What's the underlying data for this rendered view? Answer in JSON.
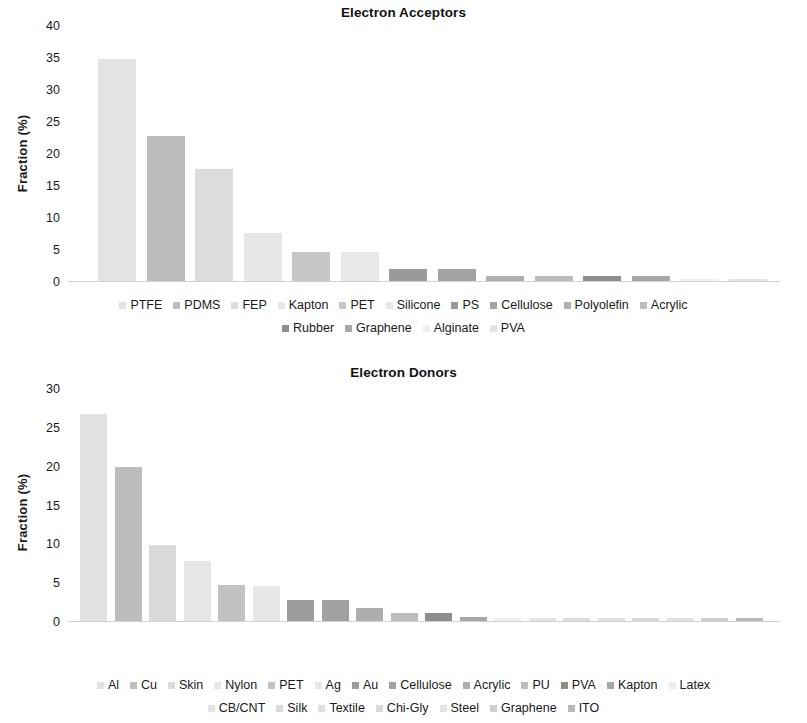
{
  "chart_data": [
    {
      "type": "bar",
      "title": "Electron Acceptors",
      "xlabel": "",
      "ylabel": "Fraction (%)",
      "ylim": [
        0,
        40
      ],
      "yticks": [
        0,
        5,
        10,
        15,
        20,
        25,
        30,
        35,
        40
      ],
      "grid": false,
      "legend_position": "bottom",
      "categories": [
        "PTFE",
        "PDMS",
        "FEP",
        "Kapton",
        "PET",
        "Silicone",
        "PS",
        "Cellulose",
        "Polyolefin",
        "Acrylic",
        "Rubber",
        "Graphene",
        "Alginate",
        "PVA"
      ],
      "values": [
        34.8,
        22.8,
        17.6,
        7.6,
        4.7,
        4.7,
        2.0,
        2.0,
        1.0,
        1.0,
        1.0,
        1.0,
        0.4,
        0.4
      ],
      "colors": [
        "#e3e3e3",
        "#bcbcbc",
        "#dcdcdc",
        "#e6e6e6",
        "#c6c6c6",
        "#e8e8e8",
        "#9a9a9a",
        "#a3a3a3",
        "#b0b0b0",
        "#bdbdbd",
        "#8f8f8f",
        "#a8a8a8",
        "#efefef",
        "#e4e4e4"
      ]
    },
    {
      "type": "bar",
      "title": "Electron Donors",
      "xlabel": "",
      "ylabel": "Fraction (%)",
      "ylim": [
        0,
        30
      ],
      "yticks": [
        0,
        5,
        10,
        15,
        20,
        25,
        30
      ],
      "grid": false,
      "legend_position": "bottom",
      "categories": [
        "Al",
        "Cu",
        "Skin",
        "Nylon",
        "PET",
        "Ag",
        "Au",
        "Cellulose",
        "Acrylic",
        "PU",
        "PVA",
        "Kapton",
        "Latex",
        "CB/CNT",
        "Silk",
        "Textile",
        "Chi-Gly",
        "Steel",
        "Graphene",
        "ITO"
      ],
      "values": [
        26.8,
        19.9,
        9.9,
        7.8,
        4.8,
        4.7,
        2.8,
        2.8,
        1.8,
        1.2,
        1.2,
        0.7,
        0.5,
        0.5,
        0.5,
        0.5,
        0.5,
        0.5,
        0.5,
        0.5
      ],
      "colors": [
        "#e2e2e2",
        "#bdbdbd",
        "#dadada",
        "#e6e6e6",
        "#c2c2c2",
        "#e7e7e7",
        "#9c9c9c",
        "#a1a1a1",
        "#aeaeae",
        "#bdbdbd",
        "#8d8d8d",
        "#a7a7a7",
        "#ededed",
        "#e3e3e3",
        "#dcdcdc",
        "#e0e0e0",
        "#d8d8d8",
        "#e2e2e2",
        "#cfcfcf",
        "#b9b9b9"
      ]
    }
  ],
  "acceptors": {
    "title": "Electron Acceptors",
    "ylabel": "Fraction (%)",
    "yticks": [
      "0",
      "5",
      "10",
      "15",
      "20",
      "25",
      "30",
      "35",
      "40"
    ],
    "legend_row_1": [
      "PTFE",
      "PDMS",
      "FEP",
      "Kapton",
      "PET",
      "Silicone",
      "PS",
      "Cellulose",
      "Polyolefin",
      "Acrylic"
    ],
    "legend_row_2": [
      "Rubber",
      "Graphene",
      "Alginate",
      "PVA"
    ]
  },
  "donors": {
    "title": "Electron Donors",
    "ylabel": "Fraction (%)",
    "yticks": [
      "0",
      "5",
      "10",
      "15",
      "20",
      "25",
      "30"
    ],
    "legend_row_1": [
      "Al",
      "Cu",
      "Skin",
      "Nylon",
      "PET",
      "Ag",
      "Au",
      "Cellulose",
      "Acrylic",
      "PU",
      "PVA",
      "Kapton",
      "Latex"
    ],
    "legend_row_2": [
      "CB/CNT",
      "Silk",
      "Textile",
      "Chi-Gly",
      "Steel",
      "Graphene",
      "ITO"
    ]
  }
}
